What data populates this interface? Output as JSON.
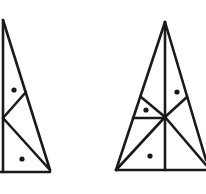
{
  "figure": {
    "ink_color": "#1a1a1a",
    "background": "#ffffff",
    "left_triangle": {
      "segments": [
        [
          3,
          20,
          3,
          172
        ],
        [
          3,
          20,
          50,
          170
        ],
        [
          0,
          172,
          50,
          172
        ],
        [
          3,
          118,
          26,
          92
        ],
        [
          3,
          118,
          50,
          170
        ]
      ],
      "dots": [
        [
          14,
          90
        ],
        [
          22,
          159
        ]
      ]
    },
    "right_triangle": {
      "segments": [
        [
          165,
          22,
          116,
          170
        ],
        [
          165,
          22,
          206,
          160
        ],
        [
          116,
          170,
          206,
          170
        ],
        [
          165,
          22,
          165,
          170
        ],
        [
          133,
          118,
          165,
          118
        ],
        [
          141,
          97,
          165,
          117
        ],
        [
          165,
          117,
          187,
          97
        ],
        [
          116,
          170,
          165,
          117
        ],
        [
          165,
          117,
          206,
          165
        ]
      ],
      "dots": [
        [
          177,
          92
        ],
        [
          146,
          110
        ],
        [
          150,
          156
        ]
      ]
    }
  }
}
